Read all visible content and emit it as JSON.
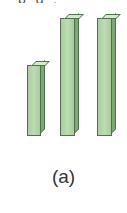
{
  "header": {
    "partial_text": "p g   ,  "
  },
  "caption": "(a)",
  "colors": {
    "bar_face": "#b3d6a9",
    "bar_side": "#7ea777",
    "bar_top": "#d4ebcb",
    "bar_edge": "#4f6f4d"
  },
  "chart_data": {
    "type": "bar",
    "title": "",
    "caption": "(a)",
    "categories": [
      "1",
      "2",
      "3"
    ],
    "values": [
      0.6,
      1.0,
      1.0
    ],
    "xlabel": "",
    "ylabel": "",
    "ylim": [
      0,
      1.0
    ],
    "grid": false,
    "legend": null,
    "style": "3d-columns",
    "pixel_geometry": [
      {
        "left": 27,
        "width": 14,
        "top": 65,
        "bottom": 136
      },
      {
        "left": 60,
        "width": 15,
        "top": 18,
        "bottom": 135
      },
      {
        "left": 97,
        "width": 15,
        "top": 18,
        "bottom": 135
      }
    ]
  }
}
